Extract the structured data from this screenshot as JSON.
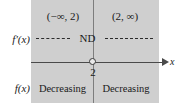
{
  "figure": {
    "type": "sign-chart",
    "background_color": "#ffffff",
    "panel_color": "#cfcfcf",
    "axis_color": "#4a4a4a",
    "text_color": "#1a1a1a"
  },
  "axis": {
    "name": "x",
    "critical_value": "2",
    "point_style": "open-circle"
  },
  "rows": {
    "intervals": {
      "left": "(−∞, 2)",
      "right": "(2, ∞)"
    },
    "derivative": {
      "label": "f′(x)",
      "center_value": "ND",
      "left_sign": "dashed",
      "right_sign": "dashed"
    },
    "function": {
      "label": "f(x)",
      "left": "Decreasing",
      "right": "Decreasing"
    }
  }
}
